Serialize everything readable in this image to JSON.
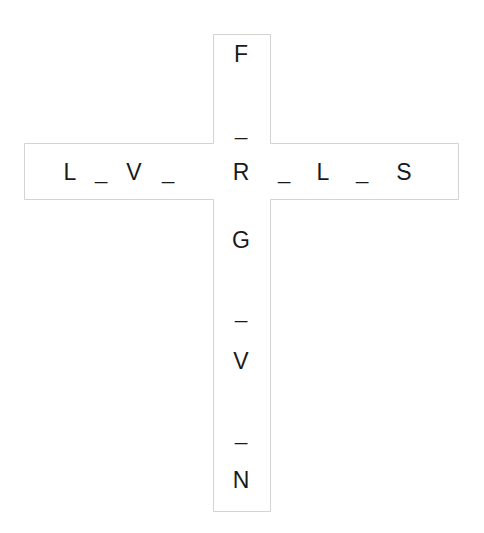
{
  "puzzle": {
    "type": "crossword-cross",
    "vertical": [
      "F",
      "_",
      "R",
      "G",
      "_",
      "V",
      "_",
      "N"
    ],
    "horizontal": [
      "L",
      "_",
      "V",
      "_",
      "R",
      "_",
      "L",
      "_",
      "S"
    ],
    "shared_letter": "R"
  },
  "colors": {
    "outline": "#d3d3d3",
    "text": "#1a1a1a",
    "background": "#ffffff"
  }
}
